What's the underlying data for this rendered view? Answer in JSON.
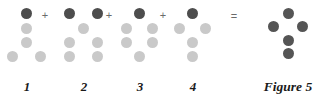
{
  "figure": {
    "caption": "Figure 5",
    "caption_x": 288,
    "caption_y": 80,
    "background_color": "#ffffff",
    "dark_dot_color": "#4d4d4d",
    "light_dot_color": "#c9c9c9",
    "result_dot_color": "#555555",
    "dot_diameter": 11
  },
  "operators": [
    {
      "name": "plus-1",
      "symbol": "+",
      "x": 45,
      "y": 15
    },
    {
      "name": "plus-2",
      "symbol": "+",
      "x": 109,
      "y": 15
    },
    {
      "name": "plus-3",
      "symbol": "+",
      "x": 163,
      "y": 15
    },
    {
      "name": "equals",
      "symbol": "=",
      "x": 234,
      "y": 16
    }
  ],
  "groups": [
    {
      "label": "1",
      "label_x": 27,
      "label_y": 80,
      "dots": [
        {
          "x": 26,
          "y": 13,
          "shade": "dark"
        },
        {
          "x": 26,
          "y": 28,
          "shade": "light"
        },
        {
          "x": 26,
          "y": 42,
          "shade": "light"
        },
        {
          "x": 12,
          "y": 56,
          "shade": "light"
        },
        {
          "x": 40,
          "y": 56,
          "shade": "light"
        }
      ]
    },
    {
      "label": "2",
      "label_x": 84,
      "label_y": 80,
      "dots": [
        {
          "x": 69,
          "y": 13,
          "shade": "dark"
        },
        {
          "x": 97,
          "y": 13,
          "shade": "dark"
        },
        {
          "x": 83,
          "y": 28,
          "shade": "light"
        },
        {
          "x": 69,
          "y": 42,
          "shade": "light"
        },
        {
          "x": 97,
          "y": 42,
          "shade": "light"
        },
        {
          "x": 69,
          "y": 56,
          "shade": "light"
        },
        {
          "x": 97,
          "y": 56,
          "shade": "light"
        }
      ]
    },
    {
      "label": "3",
      "label_x": 140,
      "label_y": 80,
      "dots": [
        {
          "x": 139,
          "y": 13,
          "shade": "dark"
        },
        {
          "x": 126,
          "y": 28,
          "shade": "light"
        },
        {
          "x": 152,
          "y": 28,
          "shade": "light"
        },
        {
          "x": 126,
          "y": 42,
          "shade": "light"
        },
        {
          "x": 152,
          "y": 42,
          "shade": "light"
        },
        {
          "x": 139,
          "y": 56,
          "shade": "light"
        }
      ]
    },
    {
      "label": "4",
      "label_x": 193,
      "label_y": 80,
      "dots": [
        {
          "x": 192,
          "y": 13,
          "shade": "dark"
        },
        {
          "x": 179,
          "y": 28,
          "shade": "light"
        },
        {
          "x": 205,
          "y": 28,
          "shade": "light"
        },
        {
          "x": 192,
          "y": 42,
          "shade": "light"
        },
        {
          "x": 192,
          "y": 56,
          "shade": "light"
        }
      ]
    }
  ],
  "result": {
    "name": "result-cross",
    "dots": [
      {
        "x": 288,
        "y": 13,
        "shade": "result"
      },
      {
        "x": 273,
        "y": 26,
        "shade": "result"
      },
      {
        "x": 302,
        "y": 26,
        "shade": "result"
      },
      {
        "x": 288,
        "y": 40,
        "shade": "result"
      },
      {
        "x": 288,
        "y": 53,
        "shade": "result"
      }
    ]
  }
}
